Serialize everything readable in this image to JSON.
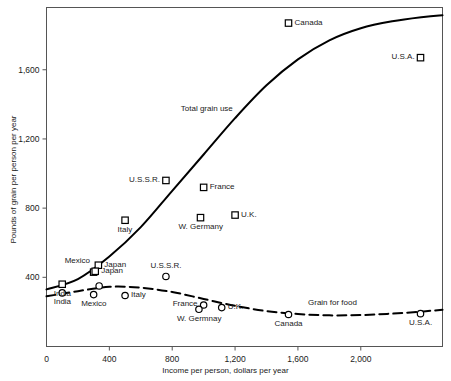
{
  "chart_data": {
    "type": "scatter",
    "title": "",
    "xlabel": "Income per person, dollars per year",
    "ylabel": "Pounds of grain per person per year",
    "xlim": [
      0,
      2520
    ],
    "ylim": [
      0,
      1960
    ],
    "xticks": [
      0,
      400,
      800,
      1200,
      1600,
      2000
    ],
    "xtick_labels": [
      "0",
      "400",
      "800",
      "1,200",
      "1,600",
      "2,000"
    ],
    "yticks": [
      400,
      800,
      1200,
      1600
    ],
    "ytick_labels": [
      "400",
      "800",
      "1,200",
      "1,600"
    ],
    "grid": false,
    "legend": "none",
    "annotations": [
      {
        "text": "Total grain use",
        "x": 1020,
        "y": 1370
      },
      {
        "text": "Grain for food",
        "x": 1820,
        "y": 250
      }
    ],
    "series": [
      {
        "name": "Total grain use",
        "marker": "square",
        "line": "solid",
        "points": [
          {
            "label": "India",
            "x": 100,
            "y": 360,
            "label_pos": "below"
          },
          {
            "label": "Mexico",
            "x": 300,
            "y": 430,
            "label_pos": "upper-left"
          },
          {
            "label": "Japan",
            "x": 330,
            "y": 470,
            "label_pos": "right"
          },
          {
            "label": "Japan",
            "x": 310,
            "y": 435,
            "label_pos": "right"
          },
          {
            "label": "Italy",
            "x": 500,
            "y": 730,
            "label_pos": "below"
          },
          {
            "label": "U.S.S.R.",
            "x": 760,
            "y": 960,
            "label_pos": "left"
          },
          {
            "label": "France",
            "x": 1000,
            "y": 920,
            "label_pos": "right"
          },
          {
            "label": "W. Germany",
            "x": 980,
            "y": 745,
            "label_pos": "below"
          },
          {
            "label": "U.K.",
            "x": 1200,
            "y": 760,
            "label_pos": "right"
          },
          {
            "label": "Canada",
            "x": 1540,
            "y": 1870,
            "label_pos": "right"
          },
          {
            "label": "U.S.A.",
            "x": 2380,
            "y": 1670,
            "label_pos": "left"
          }
        ],
        "curve": [
          {
            "x": 0,
            "y": 330
          },
          {
            "x": 200,
            "y": 390
          },
          {
            "x": 400,
            "y": 520
          },
          {
            "x": 600,
            "y": 690
          },
          {
            "x": 800,
            "y": 900
          },
          {
            "x": 1000,
            "y": 1110
          },
          {
            "x": 1200,
            "y": 1320
          },
          {
            "x": 1400,
            "y": 1510
          },
          {
            "x": 1600,
            "y": 1660
          },
          {
            "x": 1800,
            "y": 1770
          },
          {
            "x": 2000,
            "y": 1840
          },
          {
            "x": 2200,
            "y": 1880
          },
          {
            "x": 2400,
            "y": 1905
          },
          {
            "x": 2520,
            "y": 1915
          }
        ]
      },
      {
        "name": "Grain for food",
        "marker": "circle",
        "line": "dashed",
        "points": [
          {
            "label": "India",
            "x": 100,
            "y": 310,
            "label_pos": "below"
          },
          {
            "label": "Mexico",
            "x": 300,
            "y": 300,
            "label_pos": "below"
          },
          {
            "label": "",
            "x": 335,
            "y": 350,
            "label_pos": "none"
          },
          {
            "label": "Italy",
            "x": 500,
            "y": 295,
            "label_pos": "right"
          },
          {
            "label": "U.S.S.R.",
            "x": 760,
            "y": 405,
            "label_pos": "above"
          },
          {
            "label": "France",
            "x": 1000,
            "y": 240,
            "label_pos": "left"
          },
          {
            "label": "W. Germnay",
            "x": 970,
            "y": 215,
            "label_pos": "below"
          },
          {
            "label": "U.K.",
            "x": 1115,
            "y": 225,
            "label_pos": "right"
          },
          {
            "label": "Canada",
            "x": 1540,
            "y": 185,
            "label_pos": "below"
          },
          {
            "label": "U.S.A.",
            "x": 2380,
            "y": 190,
            "label_pos": "below"
          }
        ],
        "curve": [
          {
            "x": 0,
            "y": 290
          },
          {
            "x": 200,
            "y": 320
          },
          {
            "x": 400,
            "y": 345
          },
          {
            "x": 600,
            "y": 340
          },
          {
            "x": 800,
            "y": 315
          },
          {
            "x": 1000,
            "y": 275
          },
          {
            "x": 1200,
            "y": 235
          },
          {
            "x": 1400,
            "y": 205
          },
          {
            "x": 1600,
            "y": 188
          },
          {
            "x": 1800,
            "y": 180
          },
          {
            "x": 2000,
            "y": 182
          },
          {
            "x": 2200,
            "y": 190
          },
          {
            "x": 2400,
            "y": 203
          },
          {
            "x": 2520,
            "y": 212
          }
        ]
      }
    ]
  },
  "style": {
    "line_color": "#000000",
    "axis_color": "#555555",
    "text_color": "#1a1a1a",
    "background": "#ffffff"
  }
}
